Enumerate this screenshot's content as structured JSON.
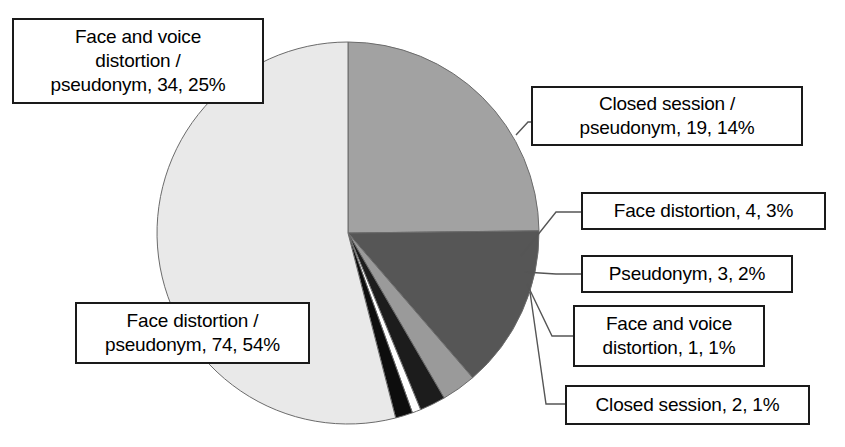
{
  "chart_data": {
    "type": "pie",
    "title": "",
    "subtitle": "",
    "xlabel": "",
    "ylabel": "",
    "total": 137,
    "legend_position": "callout-labels",
    "grid": false,
    "label_format": "{name}, {value}, {percent}%",
    "categories": [
      "Face and voice distortion / pseudonym",
      "Closed session / pseudonym",
      "Face distortion",
      "Pseudonym",
      "Face and voice distortion",
      "Closed session",
      "Face distortion / pseudonym"
    ],
    "values": [
      34,
      19,
      4,
      3,
      1,
      2,
      74
    ],
    "percents": [
      25,
      14,
      3,
      2,
      1,
      1,
      54
    ],
    "colors": [
      "#a2a2a2",
      "#565656",
      "#9a9a9a",
      "#1c1c1c",
      "#ffffff",
      "#0d0d0d",
      "#e9e9e9"
    ],
    "slices": [
      {
        "name": "Face and voice distortion / pseudonym",
        "value": 34,
        "percent": 25,
        "color": "#a2a2a2",
        "label": "Face and voice\ndistortion /\npseudonym, 34, 25%"
      },
      {
        "name": "Closed session / pseudonym",
        "value": 19,
        "percent": 14,
        "color": "#565656",
        "label": "Closed session /\npseudonym, 19, 14%"
      },
      {
        "name": "Face distortion",
        "value": 4,
        "percent": 3,
        "color": "#9a9a9a",
        "label": "Face distortion, 4, 3%"
      },
      {
        "name": "Pseudonym",
        "value": 3,
        "percent": 2,
        "color": "#1c1c1c",
        "label": "Pseudonym, 3, 2%"
      },
      {
        "name": "Face and voice distortion",
        "value": 1,
        "percent": 1,
        "color": "#ffffff",
        "label": "Face and voice\ndistortion, 1, 1%"
      },
      {
        "name": "Closed session",
        "value": 2,
        "percent": 1,
        "color": "#0d0d0d",
        "label": "Closed session, 2, 1%"
      },
      {
        "name": "Face distortion / pseudonym",
        "value": 74,
        "percent": 54,
        "color": "#e9e9e9",
        "label": "Face distortion /\npseudonym, 74, 54%"
      }
    ]
  },
  "geometry": {
    "center_x": 348,
    "center_y": 233,
    "radius": 191,
    "start_angle_deg": -90
  },
  "style": {
    "outline_color": "#6b6b6b",
    "box_border_color": "#1a1a1a",
    "text_color": "#000000",
    "leader_color": "#555555",
    "background": "#ffffff"
  }
}
